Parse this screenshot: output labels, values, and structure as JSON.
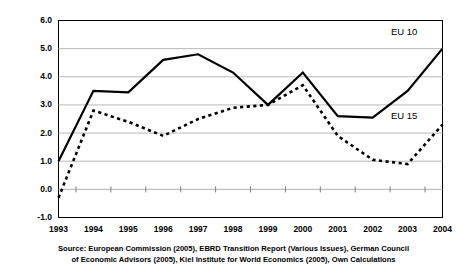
{
  "chart_data": {
    "type": "line",
    "title": "",
    "subtitle": "",
    "xlabel": "",
    "ylabel": "",
    "categories": [
      "1993",
      "1994",
      "1995",
      "1996",
      "1997",
      "1998",
      "1999",
      "2000",
      "2001",
      "2002",
      "2003",
      "2004"
    ],
    "series": [
      {
        "name": "EU 10",
        "style": "solid",
        "color": "#000000",
        "values": [
          1.0,
          3.5,
          3.45,
          4.6,
          4.8,
          4.15,
          3.0,
          4.15,
          2.6,
          2.55,
          3.5,
          5.0
        ]
      },
      {
        "name": "EU 15",
        "style": "dashed",
        "color": "#000000",
        "values": [
          -0.3,
          2.8,
          2.4,
          1.9,
          2.5,
          2.9,
          3.0,
          3.7,
          1.9,
          1.05,
          0.9,
          2.3
        ]
      }
    ],
    "ylim": [
      -1.0,
      6.0
    ],
    "yticks": [
      "6.0",
      "5.0",
      "4.0",
      "3.0",
      "2.0",
      "1.0",
      "0.0",
      "-1.0"
    ],
    "ytick_values": [
      6.0,
      5.0,
      4.0,
      3.0,
      2.0,
      1.0,
      0.0,
      -1.0
    ],
    "grid": "horizontal",
    "legend_position": "inline-right",
    "annotations": [
      {
        "text": "EU 10",
        "series": "EU 10"
      },
      {
        "text": "EU 15",
        "series": "EU 15"
      }
    ]
  },
  "source": {
    "line1": "Source: European Commission (2005), EBRD Transition Report (Various Issues), German Council",
    "line2": "of Economic Advisors (2005), Kiel Institute for World Economics (2005), Own Calculations"
  }
}
